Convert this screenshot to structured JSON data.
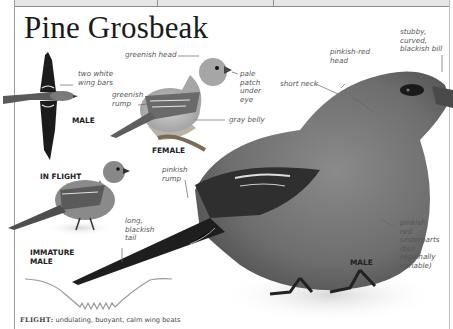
{
  "page": {
    "title": "Pine Grosbeak"
  },
  "figures": {
    "in_flight": {
      "caption": "IN FLIGHT",
      "sex_caption": "MALE",
      "labels": [
        "two white wing bars"
      ]
    },
    "female": {
      "caption": "FEMALE",
      "labels": [
        "greenish head",
        "greenish rump",
        "pale patch under eye",
        "gray belly"
      ]
    },
    "immature_male": {
      "caption": "IMMATURE MALE"
    },
    "male": {
      "caption": "MALE",
      "labels": [
        "stubby, curved, blackish bill",
        "pinkish-red head",
        "short neck",
        "pinkish rump",
        "long, blackish tail",
        "pinkish red underparts (but regionally variable)"
      ]
    }
  },
  "labels": {
    "two_white_wing_bars": "two white\nwing bars",
    "greenish_head": "greenish head",
    "greenish_rump": "greenish\nrump",
    "pale_patch": "pale\npatch\nunder\neye",
    "gray_belly": "gray belly",
    "stubby_bill": "stubby,\ncurved,\nblackish bill",
    "pinkish_red_head": "pinkish-red\nhead",
    "short_neck": "short neck",
    "pinkish_rump": "pinkish\nrump",
    "long_tail": "long,\nblackish\ntail",
    "underparts": "pinkish\nred\nunderparts\n(but\nregionally\nvariable)"
  },
  "captions": {
    "male_flight": "MALE",
    "in_flight": "IN FLIGHT",
    "female": "FEMALE",
    "immature_male": "IMMATURE\nMALE",
    "male": "MALE"
  },
  "flight_pattern": {
    "label": "FLIGHT:",
    "description": "undulating, buoyant, calm wing beats"
  },
  "colors": {
    "text": "#1a1a1a",
    "label_text": "#555555",
    "rule": "#8c8c8c",
    "flight_path": "#9a9a9a"
  }
}
